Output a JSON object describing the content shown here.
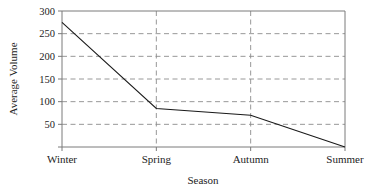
{
  "chart_data": {
    "type": "line",
    "title": "",
    "xlabel": "Season",
    "ylabel": "Average Volume",
    "categories": [
      "Winter",
      "Spring",
      "Autumn",
      "Summer"
    ],
    "values": [
      275,
      85,
      70,
      0
    ],
    "series": [
      {
        "name": "Average Volume",
        "values": [
          275,
          85,
          70,
          0
        ]
      }
    ],
    "ylim": [
      0,
      300
    ],
    "yticks": [
      50,
      100,
      150,
      200,
      250,
      300
    ],
    "ytick_labels": [
      "50",
      "100",
      "150",
      "200",
      "250",
      "300"
    ],
    "xtick_labels": [
      "Winter",
      "Spring",
      "Autumn",
      "Summer"
    ],
    "grid": {
      "horizontal": true,
      "vertical": true,
      "style": "dashed",
      "vertical_at": [
        "Spring",
        "Autumn"
      ]
    },
    "legend": null,
    "legend_position": "none",
    "colors": {
      "line": "#1a1a1a",
      "grid": "#8c8c8c",
      "frame": "#7a7a7a",
      "background": "#ffffff",
      "text": "#232323"
    }
  }
}
